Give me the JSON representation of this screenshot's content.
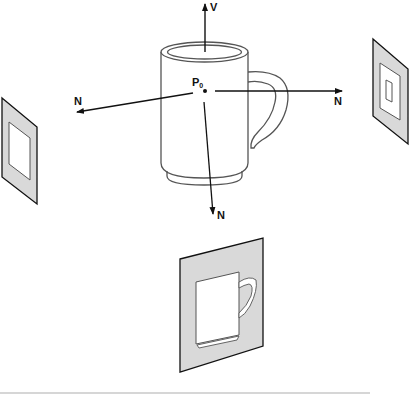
{
  "diagram": {
    "point_label": "P",
    "point_subscript": "0",
    "view_vector_label": "V",
    "normal_labels": {
      "left": "N",
      "right": "N",
      "bottom": "N"
    },
    "colors": {
      "stroke": "#111111",
      "plane_fill": "#d9d9d9",
      "mug_stroke": "#555555",
      "divider": "#c8c8c8"
    }
  }
}
